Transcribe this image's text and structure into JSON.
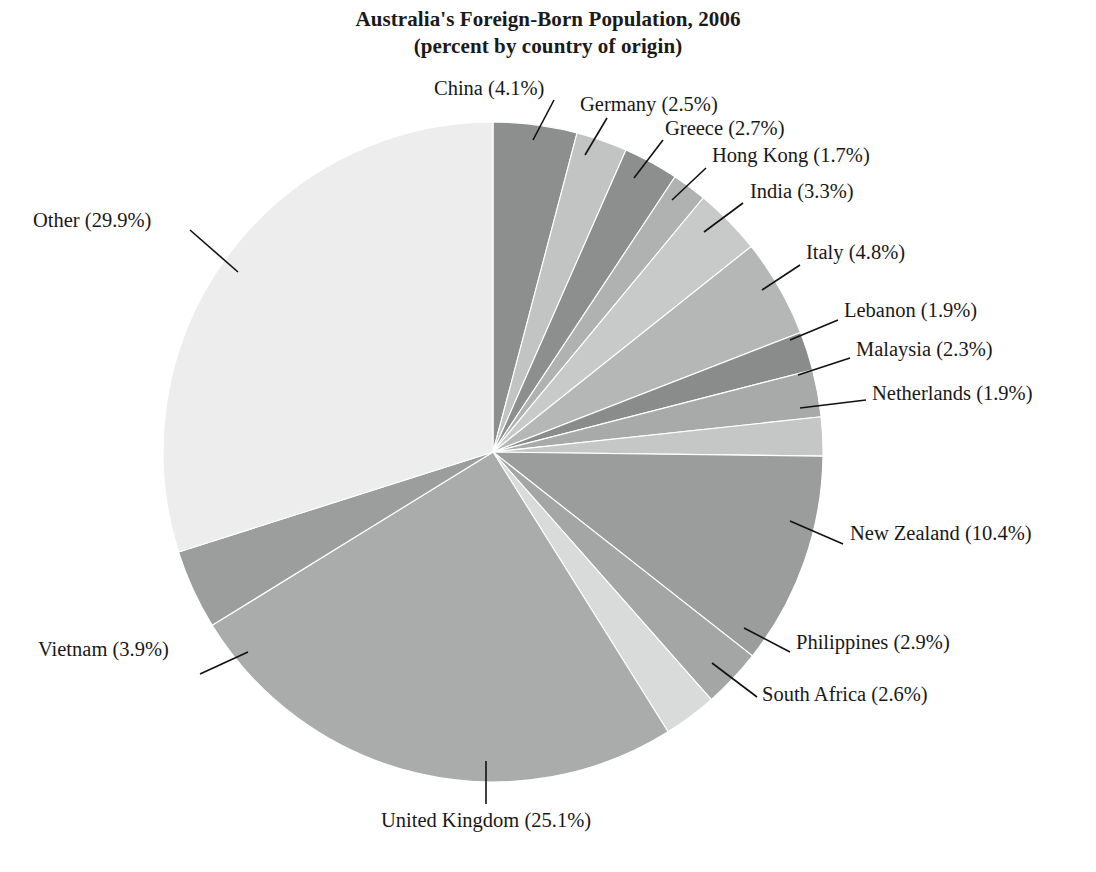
{
  "chart_data": {
    "type": "pie",
    "title": "Australia's Foreign-Born Population, 2006",
    "subtitle": "(percent by country of origin)",
    "xlabel": "",
    "ylabel": "",
    "legend_position": "none",
    "grid": false,
    "units": "percent",
    "start_angle_deg": 0,
    "direction": "clockwise",
    "categories": [
      "China",
      "Germany",
      "Greece",
      "Hong Kong",
      "India",
      "Italy",
      "Lebanon",
      "Malaysia",
      "Netherlands",
      "New Zealand",
      "Philippines",
      "South Africa",
      "United Kingdom",
      "Vietnam",
      "Other"
    ],
    "values": [
      4.1,
      2.5,
      2.7,
      1.7,
      3.3,
      4.8,
      1.9,
      2.3,
      1.9,
      10.4,
      2.9,
      2.6,
      25.1,
      3.9,
      29.9
    ],
    "slice_colors": [
      "#8d8f8e",
      "#c2c4c3",
      "#8d8f8e",
      "#b0b2b1",
      "#c8cac9",
      "#b5b7b6",
      "#8a8c8b",
      "#a8aaa9",
      "#c5c7c6",
      "#9b9d9c",
      "#a4a6a5",
      "#d9dbda",
      "#aaacab",
      "#9c9e9d",
      "#ecedec"
    ],
    "labels": [
      "China (4.1%)",
      "Germany (2.5%)",
      "Greece (2.7%)",
      "Hong Kong (1.7%)",
      "India (3.3%)",
      "Italy (4.8%)",
      "Lebanon (1.9%)",
      "Malaysia (2.3%)",
      "Netherlands (1.9%)",
      "New Zealand (10.4%)",
      "Philippines (2.9%)",
      "South Africa (2.6%)",
      "United Kingdom (25.1%)",
      "Vietnam (3.9%)",
      "Other (29.9%)"
    ]
  },
  "labels": {
    "china": "China (4.1%)",
    "germany": "Germany (2.5%)",
    "greece": "Greece (2.7%)",
    "hong_kong": "Hong Kong (1.7%)",
    "india": "India (3.3%)",
    "italy": "Italy (4.8%)",
    "lebanon": "Lebanon (1.9%)",
    "malaysia": "Malaysia (2.3%)",
    "netherlands": "Netherlands (1.9%)",
    "new_zealand": "New Zealand (10.4%)",
    "philippines": "Philippines (2.9%)",
    "south_africa": "South Africa (2.6%)",
    "united_kingdom": "United Kingdom (25.1%)",
    "vietnam": "Vietnam (3.9%)",
    "other": "Other (29.9%)"
  }
}
